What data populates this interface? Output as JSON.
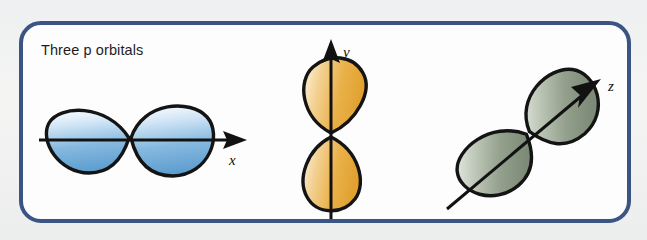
{
  "figure": {
    "caption": "Three p orbitals",
    "panel": {
      "border_color": "#3a5484",
      "background_color": "#fdfdfd",
      "corner_radius_px": 22
    },
    "page_background_color": "#f2f3f2",
    "orbitals": [
      {
        "id": "p-x",
        "name": "p x orbital",
        "axis_label": "x",
        "orientation": "horizontal",
        "axis_angle_deg": 0,
        "lobe_count": 2,
        "fill_color": "#7fb3dd",
        "fill_highlight_color": "#ffffff",
        "outline_color": "#141414"
      },
      {
        "id": "p-y",
        "name": "p y orbital",
        "axis_label": "y",
        "orientation": "vertical",
        "axis_angle_deg": 90,
        "lobe_count": 2,
        "fill_color": "#e8a838",
        "fill_highlight_color": "#fdf3dc",
        "outline_color": "#141414"
      },
      {
        "id": "p-z",
        "name": "p z orbital",
        "axis_label": "z",
        "orientation": "diagonal",
        "axis_angle_deg": 40,
        "lobe_count": 2,
        "fill_color": "#8a9684",
        "fill_highlight_color": "#f3f5f1",
        "outline_color": "#141414"
      }
    ]
  }
}
